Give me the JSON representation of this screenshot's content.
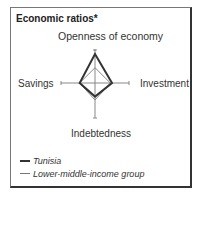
{
  "title": "Economic ratios*",
  "chart_data": {
    "type": "radar",
    "title": "Economic ratios*",
    "axes": [
      "Openness of economy",
      "Investment",
      "Indebtedness",
      "Savings"
    ],
    "axis_range": [
      0,
      1
    ],
    "series": [
      {
        "name": "Tunisia",
        "values": [
          0.85,
          0.5,
          0.4,
          0.45
        ],
        "color": "#333333",
        "line_width": 2
      },
      {
        "name": "Lower-middle-income group",
        "values": [
          0.45,
          0.45,
          0.5,
          0.45
        ],
        "color": "#888888",
        "line_width": 1
      }
    ],
    "grid": false,
    "legend_position": "bottom-left"
  },
  "labels": {
    "top": "Openness of economy",
    "right": "Investment",
    "bottom": "Indebtedness",
    "left": "Savings"
  },
  "legend": [
    {
      "label": "Tunisia"
    },
    {
      "label": "Lower-middle-income group"
    }
  ]
}
